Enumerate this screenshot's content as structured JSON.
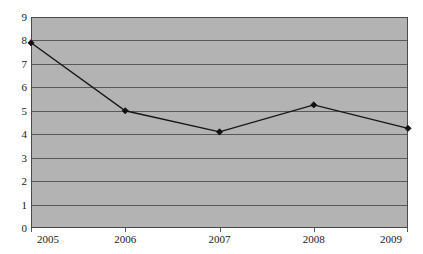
{
  "chart_data": {
    "type": "line",
    "title": "",
    "subtitle": "",
    "xlabel": "",
    "ylabel": "",
    "categories": [
      "2005",
      "2006",
      "2007",
      "2008",
      "2009"
    ],
    "x": [
      2005,
      2006,
      2007,
      2008,
      2009
    ],
    "values": [
      7.9,
      5.0,
      4.1,
      5.25,
      4.25
    ],
    "series": [
      {
        "name": "",
        "values": [
          7.9,
          5.0,
          4.1,
          5.25,
          4.25
        ]
      }
    ],
    "ylim": [
      0,
      9
    ],
    "ytick_labels": [
      "0",
      "1",
      "2",
      "3",
      "4",
      "5",
      "6",
      "7",
      "8",
      "9"
    ],
    "ytick_values": [
      0,
      1,
      2,
      3,
      4,
      5,
      6,
      7,
      8,
      9
    ],
    "xtick_labels": [
      "2005",
      "2006",
      "2007",
      "2008",
      "2009"
    ],
    "grid": "horizontal",
    "legend": "none",
    "marker": "diamond",
    "annotations": []
  },
  "style": {
    "plot_background": "#b3b3b3",
    "page_background": "#ffffff",
    "gridline_color": "#595959",
    "axis_border_color": "#4a4a4a",
    "series_color": "#161616",
    "marker_color": "#111111",
    "tick_label_color": "#1a1a1a"
  }
}
